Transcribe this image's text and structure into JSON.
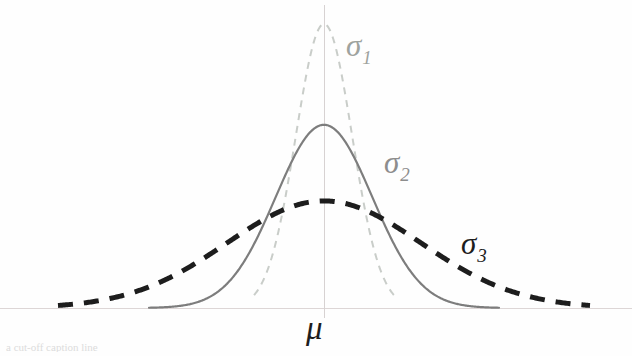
{
  "figure": {
    "background_color": "#fefefe",
    "width": 632,
    "height": 356,
    "axis_color": "#d9d2d2",
    "caption_fragment": "a cut-off caption line"
  },
  "axes": {
    "x_axis_name": "horizontal-baseline",
    "y_axis_name": "vertical-center-axis",
    "x_axis_y": 308,
    "y_axis_x": 324,
    "y_axis_top": 5,
    "y_axis_bottom": 318,
    "mean_tick_label": "μ"
  },
  "labels": {
    "sigma1": {
      "symbol": "σ",
      "subscript": "1",
      "color": "#9ea39e"
    },
    "sigma2": {
      "symbol": "σ",
      "subscript": "2",
      "color": "#8d8d8d"
    },
    "sigma3": {
      "symbol": "σ",
      "subscript": "3",
      "color": "#1d1d1d"
    },
    "mu": {
      "symbol": "μ",
      "color": "#1d1d1d"
    }
  },
  "chart_data": {
    "type": "line",
    "title": "",
    "subtitle": "",
    "xlabel": "μ",
    "ylabel": "",
    "grid": false,
    "legend_position": "inline-annotations",
    "annotations": [
      {
        "text": "σ₁",
        "x_px": 346,
        "y_px": 30,
        "color": "#9ea39e"
      },
      {
        "text": "σ₂",
        "x_px": 384,
        "y_px": 147,
        "color": "#8d8d8d"
      },
      {
        "text": "σ₃",
        "x_px": 461,
        "y_px": 228,
        "color": "#1d1d1d"
      },
      {
        "text": "μ",
        "x_px": 306,
        "y_px": 312,
        "color": "#1d1d1d"
      }
    ],
    "x": [
      -4,
      -3.5,
      -3,
      -2.5,
      -2,
      -1.5,
      -1,
      -0.5,
      0,
      0.5,
      1,
      1.5,
      2,
      2.5,
      3,
      3.5,
      4
    ],
    "xlim": [
      -4,
      4
    ],
    "ylim": [
      0,
      1
    ],
    "series": [
      {
        "name": "σ₁",
        "label": "σ₁",
        "sigma": 0.42,
        "mean": 0,
        "peak_value": 1.0,
        "color": "#c9cdc9",
        "style": "dashed",
        "width": 2,
        "values": [
          0.0,
          0.0,
          0.0,
          0.0,
          0.002,
          0.024,
          0.157,
          0.552,
          1.0,
          0.552,
          0.157,
          0.024,
          0.002,
          0.0,
          0.0,
          0.0,
          0.0
        ]
      },
      {
        "name": "σ₂",
        "label": "σ₂",
        "sigma": 0.72,
        "mean": 0,
        "peak_value": 0.645,
        "color": "#7d7d7d",
        "style": "solid",
        "width": 2,
        "values": [
          0.0,
          0.0,
          0.001,
          0.005,
          0.027,
          0.1,
          0.246,
          0.481,
          0.645,
          0.481,
          0.246,
          0.1,
          0.027,
          0.005,
          0.001,
          0.0,
          0.0
        ]
      },
      {
        "name": "σ₃",
        "label": "σ₃",
        "sigma": 1.45,
        "mean": 0,
        "peak_value": 0.377,
        "color": "#1d1d1d",
        "style": "dashed",
        "width": 5,
        "values": [
          0.017,
          0.031,
          0.054,
          0.089,
          0.14,
          0.2,
          0.266,
          0.33,
          0.377,
          0.33,
          0.266,
          0.2,
          0.14,
          0.089,
          0.054,
          0.031,
          0.017
        ]
      }
    ]
  }
}
